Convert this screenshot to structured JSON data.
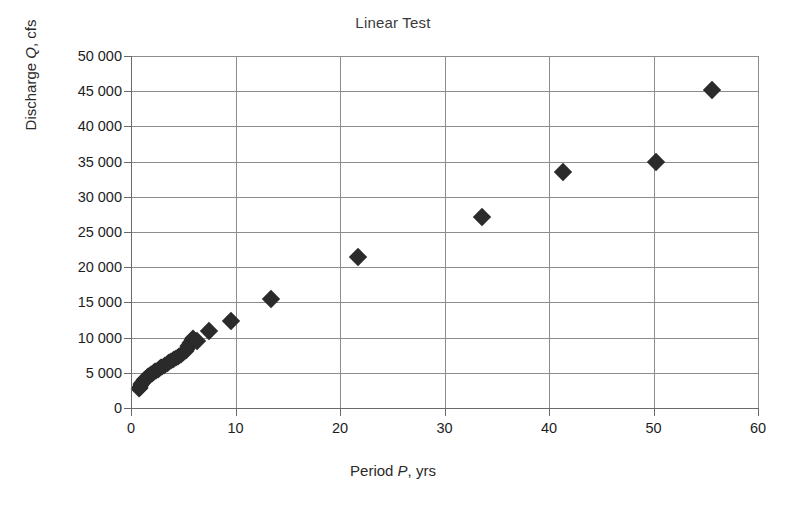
{
  "chart_data": {
    "type": "scatter",
    "title": "Linear Test",
    "xlabel": "Period P, yrs",
    "xlabel_parts": {
      "pre": "Period ",
      "italic": "P",
      "post": ", yrs"
    },
    "ylabel": "Discharge Q, cfs",
    "ylabel_parts": {
      "pre": "Discharge ",
      "italic": "Q",
      "post": ", cfs"
    },
    "xlim": [
      0,
      60
    ],
    "ylim": [
      0,
      50000
    ],
    "xticks": [
      "0",
      "10",
      "20",
      "30",
      "40",
      "50",
      "60"
    ],
    "xtick_values": [
      0,
      10,
      20,
      30,
      40,
      50,
      60
    ],
    "yticks": [
      "0",
      "5 000",
      "10 000",
      "15 000",
      "20 000",
      "25 000",
      "30 000",
      "35 000",
      "40 000",
      "45 000",
      "50 000"
    ],
    "ytick_values": [
      0,
      5000,
      10000,
      15000,
      20000,
      25000,
      30000,
      35000,
      40000,
      45000,
      50000
    ],
    "grid": "horizontal-and-vertical",
    "legend": "none",
    "marker": "filled-diamond",
    "marker_color": "#2b2b2b",
    "grid_color": "#8d8d8d",
    "axis_color": "#6a6a6a",
    "background": "#ffffff",
    "series": [
      {
        "name": "Discharge vs Period",
        "points": [
          [
            0.8,
            2750
          ],
          [
            0.85,
            2900
          ],
          [
            0.9,
            3050
          ],
          [
            0.95,
            3200
          ],
          [
            1.0,
            3350
          ],
          [
            1.05,
            3500
          ],
          [
            1.1,
            3600
          ],
          [
            1.15,
            3700
          ],
          [
            1.2,
            3820
          ],
          [
            1.28,
            3950
          ],
          [
            1.35,
            4050
          ],
          [
            1.42,
            4150
          ],
          [
            1.5,
            4280
          ],
          [
            1.58,
            4380
          ],
          [
            1.66,
            4480
          ],
          [
            1.75,
            4600
          ],
          [
            1.84,
            4700
          ],
          [
            1.93,
            4800
          ],
          [
            2.02,
            4900
          ],
          [
            2.12,
            5000
          ],
          [
            2.22,
            5120
          ],
          [
            2.32,
            5220
          ],
          [
            2.43,
            5320
          ],
          [
            2.54,
            5430
          ],
          [
            2.65,
            5540
          ],
          [
            2.77,
            5650
          ],
          [
            2.89,
            5760
          ],
          [
            3.01,
            5880
          ],
          [
            3.14,
            6000
          ],
          [
            3.27,
            6120
          ],
          [
            3.4,
            6240
          ],
          [
            3.54,
            6360
          ],
          [
            3.68,
            6490
          ],
          [
            3.83,
            6620
          ],
          [
            3.98,
            6760
          ],
          [
            4.13,
            6900
          ],
          [
            4.29,
            7050
          ],
          [
            4.45,
            7200
          ],
          [
            4.62,
            7380
          ],
          [
            4.79,
            7560
          ],
          [
            4.96,
            7750
          ],
          [
            5.1,
            7950
          ],
          [
            5.22,
            8150
          ],
          [
            5.33,
            8380
          ],
          [
            5.42,
            8600
          ],
          [
            5.5,
            8800
          ],
          [
            5.58,
            9000
          ],
          [
            5.66,
            9200
          ],
          [
            5.74,
            9400
          ],
          [
            5.82,
            9600
          ],
          [
            5.9,
            9800
          ],
          [
            5.98,
            9950
          ],
          [
            6.3,
            9500
          ],
          [
            7.5,
            11000
          ],
          [
            9.6,
            12300
          ],
          [
            13.4,
            15500
          ],
          [
            21.7,
            21500
          ],
          [
            33.6,
            27200
          ],
          [
            41.3,
            33500
          ],
          [
            50.2,
            35000
          ],
          [
            55.6,
            45200
          ]
        ]
      }
    ]
  }
}
